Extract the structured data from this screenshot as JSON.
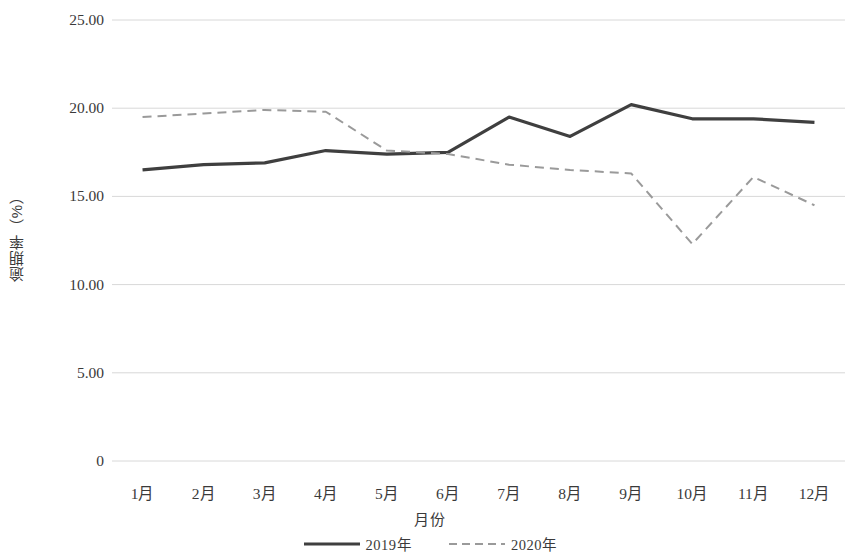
{
  "chart_data": {
    "type": "line",
    "title": "",
    "xlabel": "月份",
    "ylabel": "逾期率（%）",
    "categories": [
      "1月",
      "2月",
      "3月",
      "4月",
      "5月",
      "6月",
      "7月",
      "8月",
      "9月",
      "10月",
      "11月",
      "12月"
    ],
    "ylim": [
      0,
      25
    ],
    "yticks": [
      0,
      5,
      10,
      15,
      20,
      25
    ],
    "ytick_labels": [
      "0",
      "5.00",
      "10.00",
      "15.00",
      "20.00",
      "25.00"
    ],
    "grid": "horizontal",
    "legend_position": "bottom",
    "series": [
      {
        "name": "2019年",
        "style": "solid",
        "color": "#3f3f3f",
        "width": 3.2,
        "values": [
          16.5,
          16.8,
          16.9,
          17.6,
          17.4,
          17.5,
          19.5,
          18.4,
          20.2,
          19.4,
          19.4,
          19.2
        ]
      },
      {
        "name": "2020年",
        "style": "dashed",
        "color": "#9a9a9a",
        "width": 2.0,
        "values": [
          19.5,
          19.7,
          19.9,
          19.8,
          17.6,
          17.4,
          16.8,
          16.5,
          16.3,
          12.3,
          16.1,
          14.5
        ]
      }
    ]
  },
  "axis": {
    "y_title": "逾期率（%）",
    "x_title": "月份"
  },
  "legend": {
    "items": [
      {
        "label": "2019年",
        "style": "solid",
        "color": "#3f3f3f"
      },
      {
        "label": "2020年",
        "style": "dashed",
        "color": "#9a9a9a"
      }
    ]
  },
  "colors": {
    "series_2019": "#3f3f3f",
    "series_2020": "#9a9a9a",
    "gridline": "#d8d8d8",
    "background": "#ffffff",
    "text": "#3a3a3a"
  }
}
